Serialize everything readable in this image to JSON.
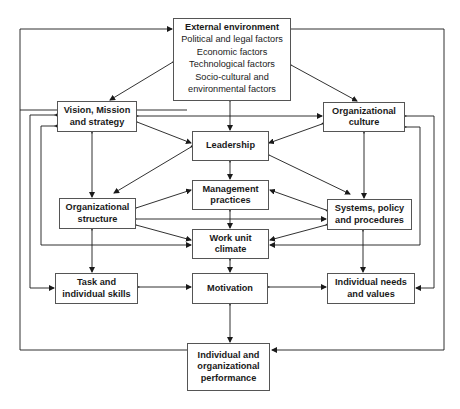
{
  "diagram": {
    "type": "flow-model",
    "nodes": {
      "external": {
        "title": "External environment",
        "lines": [
          "Political and legal factors",
          "Economic factors",
          "Technological factors",
          "Socio-cultural and",
          "environmental factors"
        ]
      },
      "vision": {
        "lines": [
          "Vision, Mission",
          "and strategy"
        ]
      },
      "culture": {
        "lines": [
          "Organizational",
          "culture"
        ]
      },
      "leadership": {
        "lines": [
          "Leadership"
        ]
      },
      "management": {
        "lines": [
          "Management",
          "practices"
        ]
      },
      "structure": {
        "lines": [
          "Organizational",
          "structure"
        ]
      },
      "systems": {
        "lines": [
          "Systems, policy",
          "and procedures"
        ]
      },
      "climate": {
        "lines": [
          "Work unit",
          "climate"
        ]
      },
      "task": {
        "lines": [
          "Task and",
          "individual skills"
        ]
      },
      "motivation": {
        "lines": [
          "Motivation"
        ]
      },
      "needs": {
        "lines": [
          "Individual needs",
          "and values"
        ]
      },
      "performance": {
        "lines": [
          "Individual and",
          "organizational",
          "performance"
        ]
      }
    },
    "colors": {
      "line": "#1a1a1a",
      "border": "#555555",
      "background": "#ffffff"
    }
  }
}
